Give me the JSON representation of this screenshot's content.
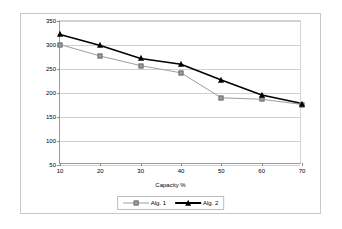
{
  "chart_data": {
    "type": "line",
    "title": "",
    "xlabel": "Capacity %",
    "ylabel": "",
    "x": [
      10,
      20,
      30,
      40,
      50,
      60,
      70
    ],
    "categories": [
      "10",
      "20",
      "30",
      "40",
      "50",
      "60",
      "70"
    ],
    "series": [
      {
        "name": "Alg. 1",
        "color": "#9e9e9e",
        "marker": "square",
        "values": [
          301,
          277,
          257,
          242,
          190,
          187,
          176
        ]
      },
      {
        "name": "Alg. 2",
        "color": "#000000",
        "marker": "triangle",
        "values": [
          322,
          299,
          272,
          260,
          227,
          196,
          178
        ]
      }
    ],
    "xlim": [
      10,
      70
    ],
    "ylim": [
      50,
      350
    ],
    "yticks": [
      50,
      100,
      150,
      200,
      250,
      300,
      350
    ],
    "ytick_labels": [
      "50",
      "100",
      "150",
      "200",
      "250",
      "300",
      "350"
    ],
    "xticks": [
      10,
      20,
      30,
      40,
      50,
      60,
      70
    ],
    "xtick_labels": [
      "10",
      "20",
      "30",
      "40",
      "50",
      "60",
      "70"
    ],
    "grid": "horizontal",
    "legend_position": "bottom",
    "legend_entries": [
      "Alg. 1",
      "Alg. 2"
    ]
  },
  "colors": {
    "series_1": "#9e9e9e",
    "series_2": "#000000",
    "gridline": "#d0d0d0",
    "axis": "#9a9a9a",
    "frame": "#c8c8c8",
    "background": "#ffffff"
  }
}
